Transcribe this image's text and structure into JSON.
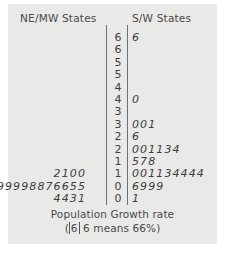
{
  "chart_data": {
    "type": "table",
    "title": "Population Growth rate",
    "subtitle": "( |6| 6 means 66%)",
    "left_header": "NE/MW States",
    "right_header": "S/W States",
    "key_left": "6",
    "key_right": "6",
    "key_text_a": "(",
    "key_text_b": "6 means 66%)",
    "stems": [
      "6",
      "6",
      "5",
      "5",
      "4",
      "4",
      "3",
      "3",
      "2",
      "2",
      "1",
      "1",
      "0",
      "0"
    ],
    "rows": [
      {
        "left": "",
        "stem": "6",
        "right": "6"
      },
      {
        "left": "",
        "stem": "6",
        "right": ""
      },
      {
        "left": "",
        "stem": "5",
        "right": ""
      },
      {
        "left": "",
        "stem": "5",
        "right": ""
      },
      {
        "left": "",
        "stem": "4",
        "right": ""
      },
      {
        "left": "",
        "stem": "4",
        "right": "0"
      },
      {
        "left": "",
        "stem": "3",
        "right": ""
      },
      {
        "left": "",
        "stem": "3",
        "right": "001"
      },
      {
        "left": "",
        "stem": "2",
        "right": "6"
      },
      {
        "left": "",
        "stem": "2",
        "right": "001134"
      },
      {
        "left": "",
        "stem": "1",
        "right": "578"
      },
      {
        "left": "2100",
        "stem": "1",
        "right": "001134444"
      },
      {
        "left": "99998876655",
        "stem": "0",
        "right": "6999"
      },
      {
        "left": "4431",
        "stem": "0",
        "right": "1"
      }
    ]
  }
}
